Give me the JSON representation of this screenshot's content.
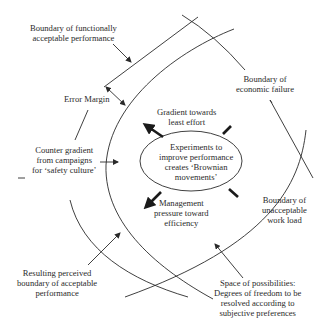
{
  "labels": {
    "functional_boundary": [
      "Boundary of functionally",
      "acceptable performance"
    ],
    "error_margin": "Error Margin",
    "counter_gradient": [
      "Counter gradient",
      "from campaigns",
      "for ‘safety culture’"
    ],
    "perceived_boundary": [
      "Resulting perceived",
      "boundary of acceptable",
      "performance"
    ],
    "gradient_least_effort": [
      "Gradient towards",
      "least effort"
    ],
    "experiments": [
      "Experiments to",
      "improve performance",
      "creates ‘Brownian",
      "movements’"
    ],
    "management_pressure": [
      "Management",
      "pressure toward",
      "efficiency"
    ],
    "economic_failure": [
      "Boundary of",
      "economic failure"
    ],
    "unacceptable_workload": [
      "Boundary of",
      "unacceptable",
      "work load"
    ],
    "space_of_possibilities": [
      "Space of possibilities:",
      "Degrees of freedom to be",
      "resolved according to",
      "subjective preferences"
    ]
  },
  "colors": {
    "line": "#2a2a2a",
    "text": "#2a2a2a",
    "background": "#ffffff"
  }
}
